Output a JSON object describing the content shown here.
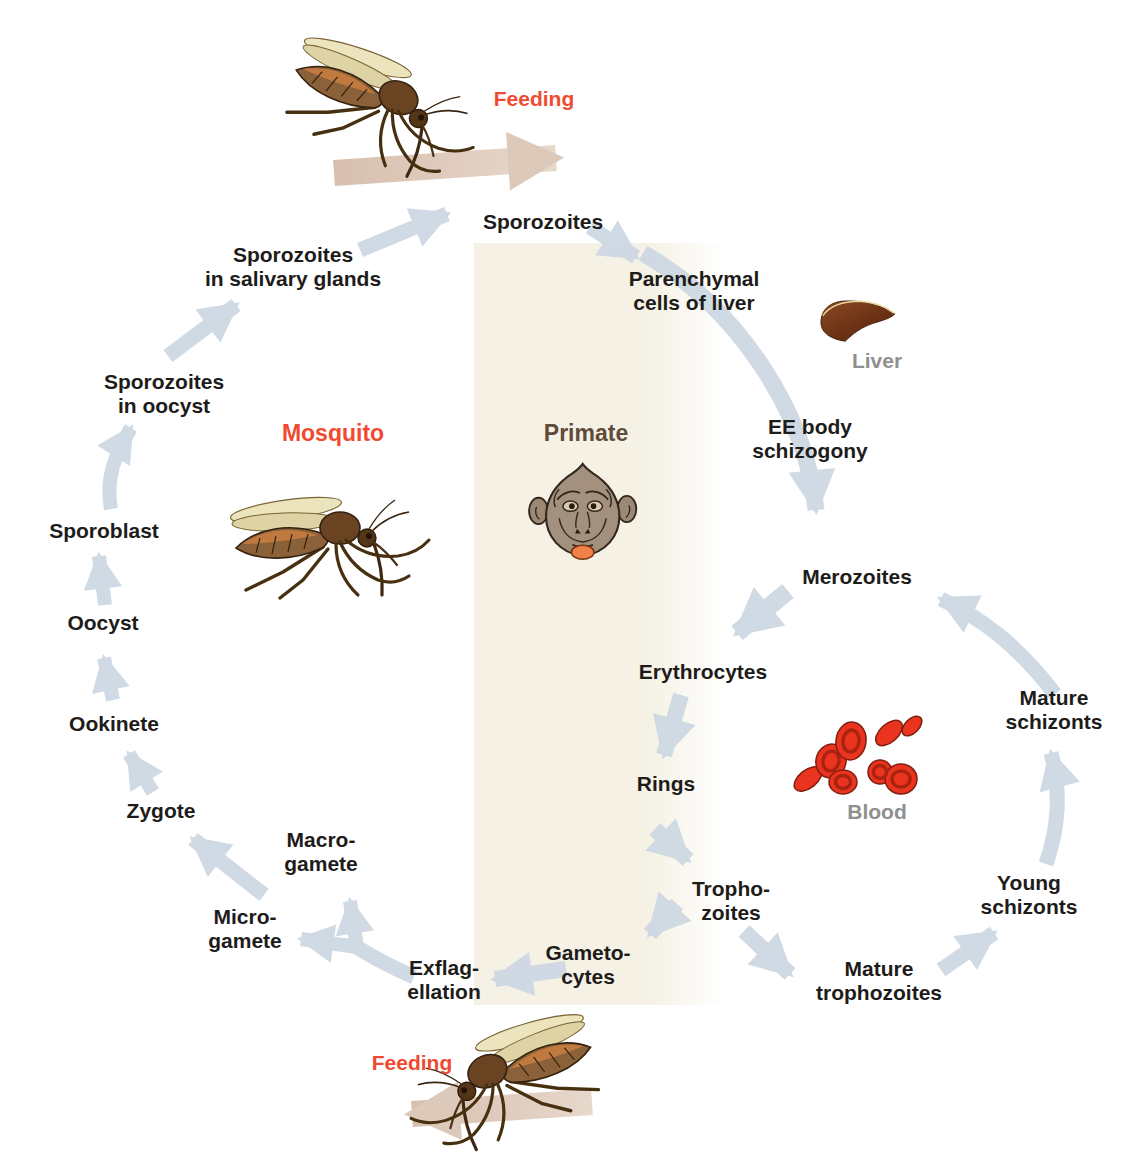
{
  "figure": {
    "type": "life-cycle-diagram",
    "hosts": {
      "mosquito": "Mosquito",
      "primate": "Primate"
    },
    "feeding_top": "Feeding",
    "feeding_bottom": "Feeding",
    "organ_labels": {
      "liver": "Liver",
      "blood": "Blood"
    },
    "stages": {
      "sporozoites": "Sporozoites",
      "parenchymal_cells": "Parenchymal\ncells of liver",
      "ee_body_schizogony": "EE body\nschizogony",
      "merozoites": "Merozoites",
      "erythrocytes": "Erythrocytes",
      "rings": "Rings",
      "trophozoites": "Tropho-\nzoites",
      "gametocytes": "Gameto-\ncytes",
      "mature_trophozoites": "Mature\ntrophozoites",
      "young_schizonts": "Young\nschizonts",
      "mature_schizonts": "Mature\nschizonts",
      "exflagellation": "Exflag-\nellation",
      "microgamete": "Micro-\ngamete",
      "macrogamete": "Macro-\ngamete",
      "zygote": "Zygote",
      "ookinete": "Ookinete",
      "oocyst": "Oocyst",
      "sporoblast": "Sporoblast",
      "sporozoites_in_oocyst": "Sporozoites\nin oocyst",
      "sporozoites_in_salivary_glands": "Sporozoites\nin salivary glands"
    },
    "colors": {
      "stage_text": "#1e1c1a",
      "accent_red": "#f04a31",
      "primate_brown": "#5f4a3b",
      "organ_gray": "#8f8f8f",
      "arrow_blue": "#cfd9e3",
      "arrow_tan": "#ddc9ba",
      "band_beige": "#f4f0e2",
      "blood_cell_red": "#ea3420",
      "liver_brown": "#6e3316"
    }
  }
}
